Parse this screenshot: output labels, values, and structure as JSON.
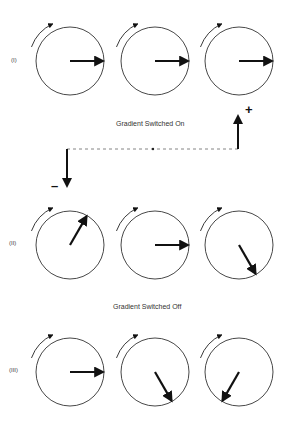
{
  "rows": [
    {
      "label": "(I)",
      "vectors": [
        0,
        0,
        0
      ]
    },
    {
      "label": "(II)",
      "vectors": [
        -60,
        0,
        60
      ]
    },
    {
      "label": "(III)",
      "vectors": [
        0,
        60,
        120
      ]
    }
  ],
  "captions": {
    "on": "Gradient Switched On",
    "off": "Gradient Switched Off"
  },
  "gradient": {
    "plus": "+",
    "minus": "–"
  }
}
